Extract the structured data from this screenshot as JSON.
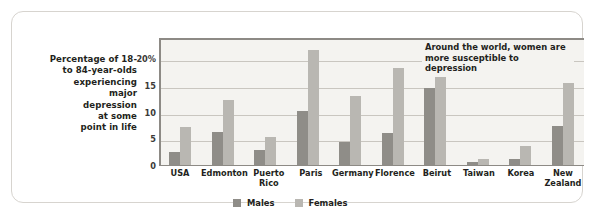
{
  "caption": {
    "lines": [
      "Percentage of 18-",
      "to 84-year-olds",
      "experiencing",
      "major",
      "depression",
      "at some",
      "point in life"
    ],
    "text": "Percentage of 18- to 84-year-olds experiencing major depression at some point in life"
  },
  "annotation": {
    "text": "Around the world, women are more susceptible to depression"
  },
  "legend": {
    "males_label": "Males",
    "females_label": "Females"
  },
  "colors": {
    "males": "#8f8d88",
    "females": "#b9b7b2",
    "plot_background": "#f4f3f0",
    "gridline": "#c9c6c0",
    "axis": "#8d8a85",
    "card_border": "#d7d4cf",
    "text": "#231f20"
  },
  "chart_data": {
    "type": "bar",
    "title": "",
    "xlabel": "",
    "ylabel": "Percentage of 18- to 84-year-olds experiencing major depression at some point in life",
    "ylim": [
      0,
      24
    ],
    "yticks": [
      0,
      5,
      10,
      15,
      20
    ],
    "ytick_labels": [
      "0",
      "5",
      "10",
      "15",
      "20%"
    ],
    "grid": true,
    "legend_position": "bottom",
    "categories": [
      "USA",
      "Edmonton",
      "Puerto Rico",
      "Paris",
      "Germany",
      "Florence",
      "Beirut",
      "Taiwan",
      "Korea",
      "New Zealand"
    ],
    "category_lines": [
      [
        "USA"
      ],
      [
        "Edmonton"
      ],
      [
        "Puerto",
        "Rico"
      ],
      [
        "Paris"
      ],
      [
        "Germany"
      ],
      [
        "Florence"
      ],
      [
        "Beirut"
      ],
      [
        "Taiwan"
      ],
      [
        "Korea"
      ],
      [
        "New",
        "Zealand"
      ]
    ],
    "series": [
      {
        "name": "Males",
        "color": "#8f8d88",
        "values": [
          2.6,
          6.4,
          3.0,
          10.4,
          4.5,
          6.2,
          14.7,
          0.8,
          1.3,
          7.5
        ]
      },
      {
        "name": "Females",
        "color": "#b9b7b2",
        "values": [
          7.3,
          12.3,
          5.4,
          21.7,
          13.2,
          18.4,
          23.1,
          1.4,
          3.8,
          15.5
        ]
      }
    ],
    "annotations": [
      {
        "text": "Around the world, women are more susceptible to depression"
      }
    ]
  }
}
